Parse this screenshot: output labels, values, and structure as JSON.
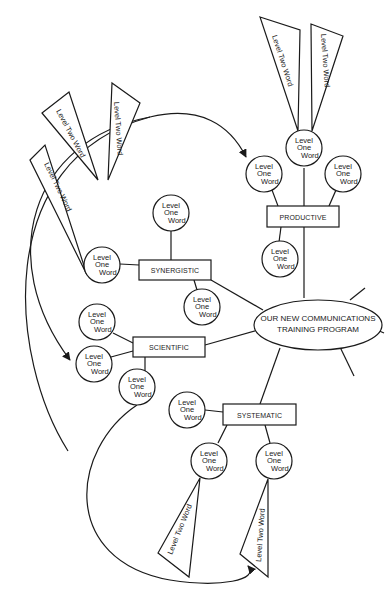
{
  "diagram": {
    "type": "mind-map",
    "center": {
      "line1": "OUR NEW COMMUNICATIONS",
      "line2": "TRAINING PROGRAM"
    },
    "branches": [
      {
        "label": "PRODUCTIVE"
      },
      {
        "label": "SYNERGISTIC"
      },
      {
        "label": "SCIENTIFIC"
      },
      {
        "label": "SYSTEMATIC"
      }
    ],
    "level_one": {
      "line1": "Level",
      "line2": "One",
      "line3": "Word"
    },
    "level_two": {
      "label": "Level Two Word"
    },
    "colors": {
      "line": "#1a1a1a",
      "background": "#ffffff"
    }
  }
}
